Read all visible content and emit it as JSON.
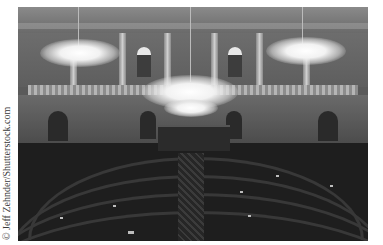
{
  "photo": {
    "subject": "legislative-chamber",
    "tone": "grayscale",
    "credit": "© Jeff Zehnder/Shutterstock.com"
  }
}
